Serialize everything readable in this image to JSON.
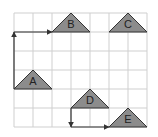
{
  "diagram": {
    "grid": {
      "cols": 7,
      "rows": 6,
      "origin_x": 14,
      "origin_y": 13,
      "cell": 19,
      "line_color": "#cfcfcf"
    },
    "shape_fill": "#8c8c8c",
    "shape_stroke": "#333333",
    "arrow_color": "#333333",
    "triangles": [
      {
        "label": "A",
        "base_left_col": 0,
        "base_row": 4
      },
      {
        "label": "B",
        "base_left_col": 2,
        "base_row": 1
      },
      {
        "label": "C",
        "base_left_col": 5,
        "base_row": 1
      },
      {
        "label": "D",
        "base_left_col": 3,
        "base_row": 5
      },
      {
        "label": "E",
        "base_left_col": 5,
        "base_row": 6
      }
    ],
    "arrows": [
      {
        "name": "path-a-to-b",
        "points": [
          [
            0,
            4
          ],
          [
            0,
            1
          ],
          [
            2,
            1
          ]
        ]
      },
      {
        "name": "path-d-to-e",
        "points": [
          [
            3,
            5
          ],
          [
            3,
            6
          ],
          [
            5,
            6
          ]
        ]
      }
    ]
  }
}
